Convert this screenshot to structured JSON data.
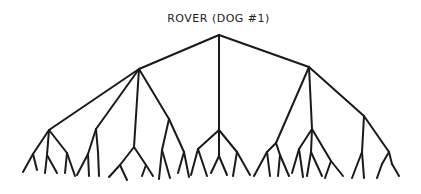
{
  "diagram": {
    "type": "tree",
    "root_label": "ROVER (DOG #1)",
    "stroke_color": "#1a1a1a",
    "background": "#ffffff",
    "nodes": {
      "R": [
        219,
        35
      ],
      "A": [
        139,
        69
      ],
      "B": [
        219,
        130
      ],
      "C": [
        309,
        67
      ],
      "A1": [
        49,
        130
      ],
      "A2": [
        96,
        129
      ],
      "A3": [
        134,
        147
      ],
      "A4": [
        169,
        119
      ],
      "A1a": [
        33,
        154
      ],
      "A1b": [
        47,
        155
      ],
      "A1c": [
        67,
        153
      ],
      "A2a": [
        88,
        154
      ],
      "A2b": [
        98,
        152
      ],
      "A3a": [
        120,
        165
      ],
      "A3b": [
        146,
        165
      ],
      "A4a": [
        162,
        150
      ],
      "A4b": [
        184,
        152
      ],
      "B1": [
        198,
        149
      ],
      "B2": [
        219,
        156
      ],
      "B3": [
        237,
        152
      ],
      "C1": [
        276,
        143
      ],
      "C2": [
        312,
        129
      ],
      "C3": [
        364,
        116
      ],
      "C1a": [
        267,
        152
      ],
      "C1b": [
        280,
        155
      ],
      "C2a": [
        299,
        149
      ],
      "C2b": [
        311,
        152
      ],
      "C2c": [
        331,
        161
      ],
      "C3a": [
        362,
        152
      ],
      "C3b": [
        389,
        152
      ],
      "C3ba": [
        382,
        164
      ],
      "C3bb": [
        392,
        164
      ]
    },
    "edges": [
      [
        "R",
        "A"
      ],
      [
        "R",
        "B"
      ],
      [
        "R",
        "C"
      ],
      [
        "A",
        "A1"
      ],
      [
        "A",
        "A2"
      ],
      [
        "A",
        "A3"
      ],
      [
        "A",
        "A4"
      ],
      [
        "A1",
        "A1a"
      ],
      [
        "A1",
        "A1b"
      ],
      [
        "A1",
        "A1c"
      ],
      [
        "A1a",
        "L1"
      ],
      [
        "A1a",
        "L2"
      ],
      [
        "A1b",
        "L3"
      ],
      [
        "A1b",
        "L4"
      ],
      [
        "A1c",
        "L5"
      ],
      [
        "A1c",
        "L6"
      ],
      [
        "A2",
        "A2a"
      ],
      [
        "A2",
        "A2b"
      ],
      [
        "A2a",
        "L7"
      ],
      [
        "A2a",
        "L8"
      ],
      [
        "A2b",
        "L9"
      ],
      [
        "A3",
        "A3a"
      ],
      [
        "A3",
        "A3b"
      ],
      [
        "A3a",
        "L10"
      ],
      [
        "A3a",
        "L11"
      ],
      [
        "A3b",
        "L12"
      ],
      [
        "A3b",
        "L13"
      ],
      [
        "A4",
        "A4a"
      ],
      [
        "A4",
        "A4b"
      ],
      [
        "A4a",
        "L14"
      ],
      [
        "A4a",
        "L15"
      ],
      [
        "A4b",
        "L16"
      ],
      [
        "A4b",
        "L17"
      ],
      [
        "B",
        "B1"
      ],
      [
        "B",
        "B2"
      ],
      [
        "B",
        "B3"
      ],
      [
        "B1",
        "L18"
      ],
      [
        "B1",
        "L19"
      ],
      [
        "B2",
        "L20"
      ],
      [
        "B2",
        "L21"
      ],
      [
        "B3",
        "L22"
      ],
      [
        "B3",
        "L23"
      ],
      [
        "C",
        "C1"
      ],
      [
        "C",
        "C2"
      ],
      [
        "C",
        "C3"
      ],
      [
        "C1",
        "C1a"
      ],
      [
        "C1",
        "C1b"
      ],
      [
        "C1a",
        "L24"
      ],
      [
        "C1a",
        "L25"
      ],
      [
        "C1b",
        "L26"
      ],
      [
        "C1b",
        "L27"
      ],
      [
        "C2",
        "C2a"
      ],
      [
        "C2",
        "C2b"
      ],
      [
        "C2",
        "C2c"
      ],
      [
        "C2a",
        "L28"
      ],
      [
        "C2a",
        "L29"
      ],
      [
        "C2b",
        "L30"
      ],
      [
        "C2b",
        "L31"
      ],
      [
        "C2c",
        "L32"
      ],
      [
        "C2c",
        "L33"
      ],
      [
        "C3",
        "C3a"
      ],
      [
        "C3",
        "C3b"
      ],
      [
        "C3a",
        "L34"
      ],
      [
        "C3a",
        "L35"
      ],
      [
        "C3b",
        "C3ba"
      ],
      [
        "C3b",
        "C3bb"
      ],
      [
        "C3ba",
        "L36"
      ],
      [
        "C3bb",
        "L37"
      ]
    ],
    "leaves": {
      "L1": [
        23,
        172
      ],
      "L2": [
        37,
        170
      ],
      "L3": [
        45,
        173
      ],
      "L4": [
        57,
        173
      ],
      "L5": [
        65,
        173
      ],
      "L6": [
        75,
        176
      ],
      "L7": [
        77,
        175
      ],
      "L8": [
        89,
        176
      ],
      "L9": [
        99,
        176
      ],
      "L10": [
        109,
        177
      ],
      "L11": [
        127,
        180
      ],
      "L12": [
        142,
        176
      ],
      "L13": [
        153,
        176
      ],
      "L14": [
        159,
        179
      ],
      "L15": [
        170,
        178
      ],
      "L16": [
        178,
        173
      ],
      "L17": [
        189,
        177
      ],
      "L18": [
        191,
        175
      ],
      "L19": [
        207,
        176
      ],
      "L20": [
        211,
        173
      ],
      "L21": [
        227,
        175
      ],
      "L22": [
        233,
        176
      ],
      "L23": [
        250,
        175
      ],
      "L24": [
        254,
        176
      ],
      "L25": [
        270,
        176
      ],
      "L26": [
        278,
        176
      ],
      "L27": [
        289,
        176
      ],
      "L28": [
        292,
        173
      ],
      "L29": [
        303,
        177
      ],
      "L30": [
        307,
        176
      ],
      "L31": [
        322,
        176
      ],
      "L32": [
        325,
        178
      ],
      "L33": [
        343,
        176
      ],
      "L34": [
        352,
        178
      ],
      "L35": [
        364,
        178
      ],
      "L36": [
        377,
        178
      ],
      "L37": [
        399,
        176
      ]
    }
  }
}
